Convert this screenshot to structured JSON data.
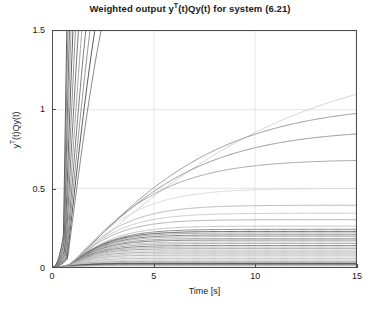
{
  "chart_data": {
    "type": "line",
    "title": "Weighted output yT(t)Qy(t) for system (6.21)",
    "title_html": "Weighted output y<sup>T</sup>(t)Qy(t) for system (6.21)",
    "xlabel": "Time [s]",
    "ylabel": "yT(t)Qy(t)",
    "ylabel_html": "y<sup>T</sup>(t)Qy(t)",
    "xlim": [
      0,
      15
    ],
    "ylim": [
      0,
      1.5
    ],
    "xticks": [
      0,
      5,
      10,
      15
    ],
    "xtick_labels": [
      "0",
      "5",
      "10",
      "15"
    ],
    "yticks": [
      0,
      0.5,
      1,
      1.5
    ],
    "ytick_labels": [
      "0",
      "0.5",
      "1",
      "1.5"
    ],
    "grid": true,
    "grid_color": "#d9d9d9",
    "legend": "none",
    "axis_color": "#4d4d4d",
    "background": "#ffffff",
    "series_count": 42,
    "series": [
      {
        "name": "curve-01",
        "plateau": 1.33,
        "rise": 5.6,
        "delay": 1.0,
        "color": "#c8c8c8",
        "width": 0.8
      },
      {
        "name": "curve-02",
        "plateau": 1.02,
        "rise": 3.6,
        "delay": 0.95,
        "color": "#8c8c8c",
        "width": 0.9
      },
      {
        "name": "curve-03",
        "plateau": 0.86,
        "rise": 3.1,
        "delay": 0.9,
        "color": "#8a8a8a",
        "width": 0.9
      },
      {
        "name": "curve-04",
        "plateau": 0.67,
        "rise": 2.3,
        "delay": 0.85,
        "color": "#9a9a9a",
        "width": 0.9
      },
      {
        "name": "curve-05",
        "plateau": 0.49,
        "rise": 1.7,
        "delay": 0.8,
        "color": "#d2d2d2",
        "width": 0.8
      },
      {
        "name": "curve-06",
        "plateau": 0.385,
        "rise": 1.45,
        "delay": 0.78,
        "color": "#a8a8a8",
        "width": 0.8
      },
      {
        "name": "curve-07",
        "plateau": 0.335,
        "rise": 1.35,
        "delay": 0.76,
        "color": "#bdbdbd",
        "width": 0.8
      },
      {
        "name": "curve-08",
        "plateau": 0.295,
        "rise": 1.25,
        "delay": 0.74,
        "color": "#9e9e9e",
        "width": 0.8
      },
      {
        "name": "curve-09",
        "plateau": 0.255,
        "rise": 1.2,
        "delay": 0.72,
        "color": "#b5b5b5",
        "width": 0.8
      },
      {
        "name": "curve-10",
        "plateau": 0.235,
        "rise": 1.15,
        "delay": 0.7,
        "color": "#777777",
        "width": 0.9
      },
      {
        "name": "curve-11",
        "plateau": 0.222,
        "rise": 1.1,
        "delay": 0.7,
        "color": "#5e5e5e",
        "width": 1.0
      },
      {
        "name": "curve-12",
        "plateau": 0.212,
        "rise": 1.08,
        "delay": 0.69,
        "color": "#8f8f8f",
        "width": 0.8
      },
      {
        "name": "curve-13",
        "plateau": 0.2,
        "rise": 1.05,
        "delay": 0.68,
        "color": "#6b6b6b",
        "width": 0.9
      },
      {
        "name": "curve-14",
        "plateau": 0.19,
        "rise": 1.02,
        "delay": 0.67,
        "color": "#a2a2a2",
        "width": 0.8
      },
      {
        "name": "curve-15",
        "plateau": 0.178,
        "rise": 1.0,
        "delay": 0.66,
        "color": "#8a8a8a",
        "width": 0.8
      },
      {
        "name": "curve-16",
        "plateau": 0.168,
        "rise": 0.98,
        "delay": 0.65,
        "color": "#707070",
        "width": 0.9
      },
      {
        "name": "curve-17",
        "plateau": 0.156,
        "rise": 0.95,
        "delay": 0.64,
        "color": "#b0b0b0",
        "width": 0.8
      },
      {
        "name": "curve-18",
        "plateau": 0.146,
        "rise": 0.93,
        "delay": 0.63,
        "color": "#8d8d8d",
        "width": 0.8
      },
      {
        "name": "curve-19",
        "plateau": 0.134,
        "rise": 0.9,
        "delay": 0.62,
        "color": "#6e6e6e",
        "width": 0.9
      },
      {
        "name": "curve-20",
        "plateau": 0.124,
        "rise": 0.88,
        "delay": 0.61,
        "color": "#a6a6a6",
        "width": 0.8
      },
      {
        "name": "curve-21",
        "plateau": 0.114,
        "rise": 0.86,
        "delay": 0.6,
        "color": "#858585",
        "width": 0.8
      },
      {
        "name": "curve-22",
        "plateau": 0.104,
        "rise": 0.84,
        "delay": 0.59,
        "color": "#c0c0c0",
        "width": 0.8
      },
      {
        "name": "curve-23",
        "plateau": 0.094,
        "rise": 0.82,
        "delay": 0.58,
        "color": "#909090",
        "width": 0.8
      },
      {
        "name": "curve-24",
        "plateau": 0.084,
        "rise": 0.8,
        "delay": 0.57,
        "color": "#b8b8b8",
        "width": 0.8
      },
      {
        "name": "curve-25",
        "plateau": 0.074,
        "rise": 0.78,
        "delay": 0.56,
        "color": "#9b9b9b",
        "width": 0.8
      },
      {
        "name": "curve-26",
        "plateau": 0.064,
        "rise": 0.76,
        "delay": 0.55,
        "color": "#cacaca",
        "width": 0.8
      },
      {
        "name": "curve-27",
        "plateau": 0.054,
        "rise": 0.74,
        "delay": 0.54,
        "color": "#a4a4a4",
        "width": 0.8
      },
      {
        "name": "curve-28",
        "plateau": 0.044,
        "rise": 0.72,
        "delay": 0.53,
        "color": "#c5c5c5",
        "width": 0.8
      },
      {
        "name": "curve-29",
        "plateau": 0.036,
        "rise": 0.7,
        "delay": 0.52,
        "color": "#8e8e8e",
        "width": 0.8
      },
      {
        "name": "curve-30",
        "plateau": 0.03,
        "rise": 0.68,
        "delay": 0.51,
        "color": "#bfbfbf",
        "width": 0.8
      },
      {
        "name": "curve-31",
        "plateau": 0.024,
        "rise": 0.66,
        "delay": 0.5,
        "color": "#6a6a6a",
        "width": 1.0
      },
      {
        "name": "curve-32",
        "plateau": 0.02,
        "rise": 0.64,
        "delay": 0.5,
        "color": "#4a4a4a",
        "width": 1.3
      },
      {
        "name": "curve-33",
        "plateau": 0.015,
        "rise": 0.62,
        "delay": 0.49,
        "color": "#808080",
        "width": 0.9
      },
      {
        "name": "curve-34",
        "plateau": 0.01,
        "rise": 0.6,
        "delay": 0.48,
        "color": "#a0a0a0",
        "width": 0.8
      },
      {
        "name": "curve-35",
        "plateau": 0.006,
        "rise": 0.58,
        "delay": 0.47,
        "color": "#c8c8c8",
        "width": 0.8
      },
      {
        "name": "curve-36",
        "plateau": 2.6,
        "rise": 1.2,
        "delay": 0.72,
        "color": "#787878",
        "width": 0.9
      },
      {
        "name": "curve-37",
        "plateau": 2.85,
        "rise": 1.12,
        "delay": 0.7,
        "color": "#5a5a5a",
        "width": 1.0
      },
      {
        "name": "curve-38",
        "plateau": 3.1,
        "rise": 1.05,
        "delay": 0.68,
        "color": "#8b8b8b",
        "width": 0.9
      },
      {
        "name": "curve-39",
        "plateau": 3.4,
        "rise": 0.98,
        "delay": 0.66,
        "color": "#6f6f6f",
        "width": 0.9
      },
      {
        "name": "curve-40",
        "plateau": 3.8,
        "rise": 0.92,
        "delay": 0.64,
        "color": "#9c9c9c",
        "width": 0.9
      },
      {
        "name": "curve-41",
        "plateau": 4.3,
        "rise": 0.86,
        "delay": 0.62,
        "color": "#777777",
        "width": 1.0
      },
      {
        "name": "curve-42",
        "plateau": 4.9,
        "rise": 0.8,
        "delay": 0.6,
        "color": "#888888",
        "width": 0.9
      },
      {
        "name": "curve-43",
        "plateau": 5.6,
        "rise": 0.74,
        "delay": 0.58,
        "color": "#606060",
        "width": 1.0
      },
      {
        "name": "curve-44",
        "plateau": 6.4,
        "rise": 0.7,
        "delay": 0.56,
        "color": "#9e9e9e",
        "width": 0.9
      },
      {
        "name": "curve-45",
        "plateau": 7.4,
        "rise": 0.66,
        "delay": 0.55,
        "color": "#707070",
        "width": 1.0
      },
      {
        "name": "curve-46",
        "plateau": 8.6,
        "rise": 0.62,
        "delay": 0.53,
        "color": "#858585",
        "width": 0.9
      },
      {
        "name": "curve-47",
        "plateau": 10.2,
        "rise": 0.58,
        "delay": 0.52,
        "color": "#5f5f5f",
        "width": 1.0
      }
    ]
  }
}
